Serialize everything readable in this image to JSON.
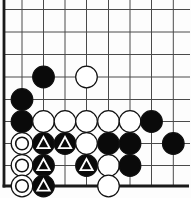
{
  "board": {
    "grid": {
      "visible_cols": 9,
      "visible_rows": 9,
      "thick_edges": [
        "left",
        "bottom"
      ],
      "cropped_edges": [
        "top",
        "right"
      ]
    },
    "colors": {
      "background": "#fdfdfd",
      "grid_line": "#4a4a4a",
      "board_edge": "#1a1a1a",
      "black_stone": "#0a0a0a",
      "white_stone": "#ffffff",
      "stone_outline": "#111111",
      "triangle_mark": "#ffffff",
      "circle_mark": "#111111"
    },
    "stones": [
      {
        "col": 2,
        "row": 3,
        "color": "black",
        "mark": ""
      },
      {
        "col": 4,
        "row": 3,
        "color": "white",
        "mark": ""
      },
      {
        "col": 1,
        "row": 4,
        "color": "black",
        "mark": ""
      },
      {
        "col": 1,
        "row": 5,
        "color": "black",
        "mark": ""
      },
      {
        "col": 2,
        "row": 5,
        "color": "white",
        "mark": ""
      },
      {
        "col": 3,
        "row": 5,
        "color": "white",
        "mark": ""
      },
      {
        "col": 4,
        "row": 5,
        "color": "white",
        "mark": ""
      },
      {
        "col": 5,
        "row": 5,
        "color": "white",
        "mark": ""
      },
      {
        "col": 6,
        "row": 5,
        "color": "white",
        "mark": ""
      },
      {
        "col": 7,
        "row": 5,
        "color": "black",
        "mark": ""
      },
      {
        "col": 1,
        "row": 6,
        "color": "white",
        "mark": "circle"
      },
      {
        "col": 2,
        "row": 6,
        "color": "black",
        "mark": "triangle"
      },
      {
        "col": 3,
        "row": 6,
        "color": "black",
        "mark": "triangle"
      },
      {
        "col": 4,
        "row": 6,
        "color": "white",
        "mark": ""
      },
      {
        "col": 5,
        "row": 6,
        "color": "black",
        "mark": ""
      },
      {
        "col": 6,
        "row": 6,
        "color": "black",
        "mark": ""
      },
      {
        "col": 8,
        "row": 6,
        "color": "black",
        "mark": ""
      },
      {
        "col": 1,
        "row": 7,
        "color": "white",
        "mark": "circle"
      },
      {
        "col": 2,
        "row": 7,
        "color": "black",
        "mark": "triangle"
      },
      {
        "col": 4,
        "row": 7,
        "color": "black",
        "mark": "triangle"
      },
      {
        "col": 5,
        "row": 7,
        "color": "white",
        "mark": ""
      },
      {
        "col": 6,
        "row": 7,
        "color": "black",
        "mark": ""
      },
      {
        "col": 1,
        "row": 8,
        "color": "white",
        "mark": "circle"
      },
      {
        "col": 2,
        "row": 8,
        "color": "black",
        "mark": "triangle"
      },
      {
        "col": 5,
        "row": 8,
        "color": "white",
        "mark": ""
      }
    ]
  }
}
